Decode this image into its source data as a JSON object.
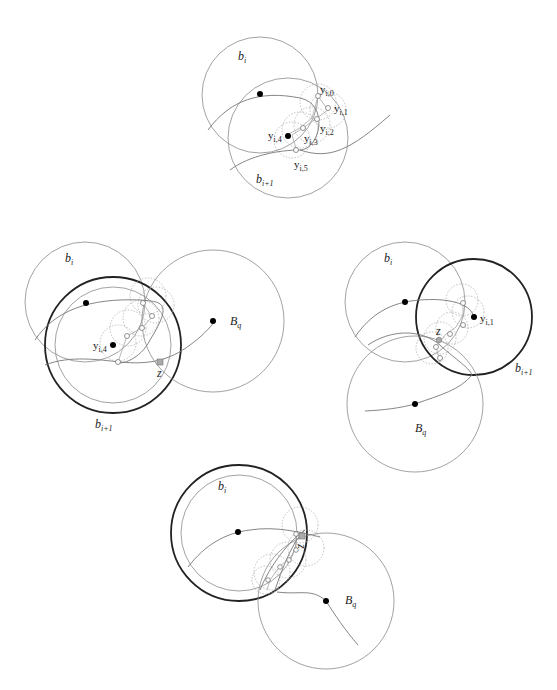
{
  "panels": [
    {
      "id": "top",
      "labels": {
        "bi": "b",
        "bi_sub": "i",
        "bi1": "b",
        "bi1_sub": "i+1",
        "y0": "y",
        "y0_sub": "i,0",
        "y1": "y",
        "y1_sub": "i,1",
        "y2": "y",
        "y2_sub": "i,2",
        "y3": "y",
        "y3_sub": "i,3",
        "y4": "y",
        "y4_sub": "i,4",
        "y5": "y",
        "y5_sub": "i,5"
      }
    },
    {
      "id": "middle-left",
      "labels": {
        "bi": "b",
        "bi_sub": "i",
        "bi1": "b",
        "bi1_sub": "i+1",
        "Bq": "B",
        "Bq_sub": "q",
        "y4": "y",
        "y4_sub": "i,4",
        "z": "z"
      }
    },
    {
      "id": "middle-right",
      "labels": {
        "bi": "b",
        "bi_sub": "i",
        "bi1": "b",
        "bi1_sub": "i+1",
        "Bq": "B",
        "Bq_sub": "q",
        "y1": "y",
        "y1_sub": "i,1",
        "z": "z"
      }
    },
    {
      "id": "bottom",
      "labels": {
        "bi": "b",
        "bi_sub": "i",
        "Bq": "B",
        "Bq_sub": "q",
        "z": "z"
      }
    }
  ]
}
